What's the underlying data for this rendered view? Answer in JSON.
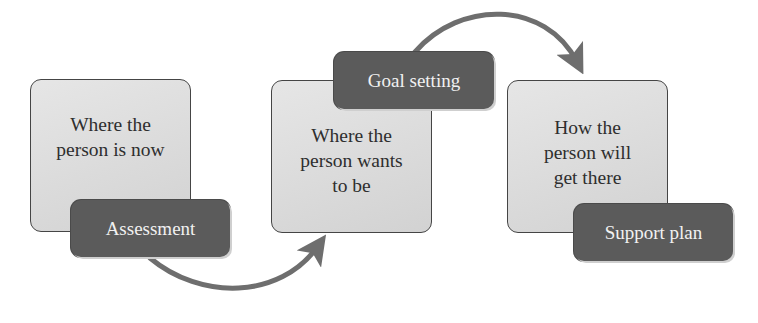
{
  "diagram": {
    "title": "",
    "stages": [
      {
        "box_text": "Where the\nperson is now",
        "step_label": "Assessment"
      },
      {
        "box_text": "Where the\nperson wants\nto be",
        "step_label": "Goal setting"
      },
      {
        "box_text": "How the\nperson will\nget there",
        "step_label": "Support plan"
      }
    ],
    "connectors": [
      {
        "from": "Assessment",
        "to": "Where the person wants to be",
        "icon": "curved-arrow-icon"
      },
      {
        "from": "Goal setting",
        "to": "How the person will get there",
        "icon": "curved-arrow-icon"
      }
    ],
    "colors": {
      "box_fill": "#dcdcdc",
      "box_border": "#454545",
      "pill_fill": "#5b5b5b",
      "pill_text": "#f1f1f1",
      "arrow": "#6e6e6e"
    }
  }
}
